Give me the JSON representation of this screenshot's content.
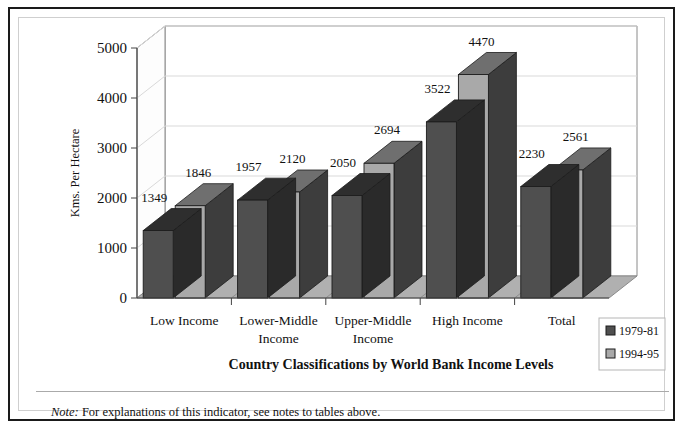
{
  "figure": {
    "note_label": "Note:",
    "note_text": " For explanations of this indicator, see notes to tables above."
  },
  "chart_data": {
    "type": "bar",
    "subtype": "grouped-3d-column",
    "title": "Country Classifications by World Bank Income Levels",
    "xlabel": "Country Classifications by World Bank Income Levels",
    "ylabel": "Kms. Per Hectare",
    "ylim": [
      0,
      5000
    ],
    "ytick_step": 1000,
    "yticks": [
      "0",
      "1000",
      "2000",
      "3000",
      "4000",
      "5000"
    ],
    "grid": "horizontal",
    "legend_position": "bottom-right",
    "categories": [
      "Low Income",
      "Lower-Middle Income",
      "Upper-Middle Income",
      "High Income",
      "Total"
    ],
    "category_lines": [
      [
        "Low Income"
      ],
      [
        "Lower-Middle",
        "Income"
      ],
      [
        "Upper-Middle",
        "Income"
      ],
      [
        "High Income"
      ],
      [
        "Total"
      ]
    ],
    "series": [
      {
        "name": "1979-81",
        "color": "#4f4f4f",
        "top_color": "#2e2e2e",
        "side_color": "#2a2a2a",
        "values": [
          1349,
          1957,
          2050,
          3522,
          2230
        ]
      },
      {
        "name": "1994-95",
        "color": "#a9a9a9",
        "top_color": "#6f6f6f",
        "side_color": "#3d3d3d",
        "values": [
          1846,
          2120,
          2694,
          4470,
          2561
        ]
      }
    ],
    "data_labels": [
      [
        "1349",
        "1846"
      ],
      [
        "1957",
        "2120"
      ],
      [
        "2050",
        "2694"
      ],
      [
        "3522",
        "4470"
      ],
      [
        "2230",
        "2561"
      ]
    ],
    "floor_color": "#b0b0b0",
    "wall_color": "#ffffff",
    "gridline_color": "#d9d9d9"
  }
}
